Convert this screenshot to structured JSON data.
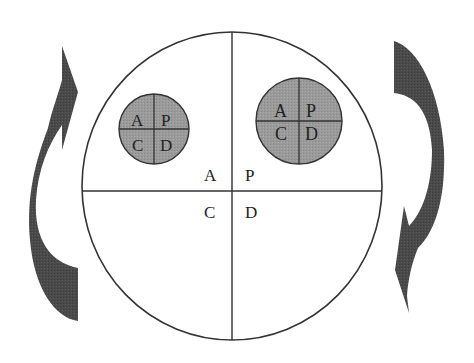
{
  "diagram": {
    "type": "PDCA cycle (nested)",
    "colors": {
      "background": "#ffffff",
      "line": "#333333",
      "small_circle_fill": "#9a9a9a",
      "arrow_fill": "#4a4a4a"
    },
    "main_circle": {
      "quadrants": {
        "top_left": "A",
        "top_right": "P",
        "bottom_left": "C",
        "bottom_right": "D"
      }
    },
    "small_circle_left": {
      "quadrants": {
        "top_left": "A",
        "top_right": "P",
        "bottom_left": "C",
        "bottom_right": "D"
      }
    },
    "small_circle_right": {
      "quadrants": {
        "top_left": "A",
        "top_right": "P",
        "bottom_left": "C",
        "bottom_right": "D"
      }
    },
    "arrows": [
      {
        "side": "left",
        "direction": "upward",
        "icon": "curved-arrow-up-icon"
      },
      {
        "side": "right",
        "direction": "downward",
        "icon": "curved-arrow-down-icon"
      }
    ]
  }
}
